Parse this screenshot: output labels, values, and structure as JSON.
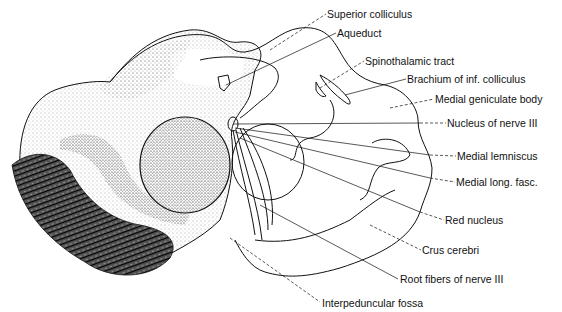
{
  "figure": {
    "type": "anatomical cross-section (midbrain at level of superior colliculus)",
    "ink_color": "#111111",
    "background": "#ffffff"
  },
  "labels": [
    {
      "id": "superior-colliculus",
      "text": "Superior colliculus",
      "x": 327,
      "y": 8
    },
    {
      "id": "aqueduct",
      "text": "Aqueduct",
      "x": 337,
      "y": 27
    },
    {
      "id": "spinothalamic-tract",
      "text": "Spinothalamic tract",
      "x": 365,
      "y": 55
    },
    {
      "id": "brachium-inf-colliculus",
      "text": "Brachium of inf. colliculus",
      "x": 407,
      "y": 73
    },
    {
      "id": "medial-geniculate-body",
      "text": "Medial geniculate body",
      "x": 435,
      "y": 93
    },
    {
      "id": "nucleus-nerve-iii",
      "text": "Nucleus of nerve III",
      "x": 447,
      "y": 117
    },
    {
      "id": "medial-lemniscus",
      "text": "Medial lemniscus",
      "x": 457,
      "y": 150
    },
    {
      "id": "medial-long-fasc",
      "text": "Medial long. fasc.",
      "x": 456,
      "y": 176
    },
    {
      "id": "red-nucleus",
      "text": "Red nucleus",
      "x": 445,
      "y": 214
    },
    {
      "id": "crus-cerebri",
      "text": "Crus cerebri",
      "x": 422,
      "y": 244
    },
    {
      "id": "root-fibers-nerve-iii",
      "text": "Root fibers of nerve III",
      "x": 400,
      "y": 273
    },
    {
      "id": "interpeduncular-fossa",
      "text": "Interpeduncular fossa",
      "x": 322,
      "y": 297
    }
  ]
}
